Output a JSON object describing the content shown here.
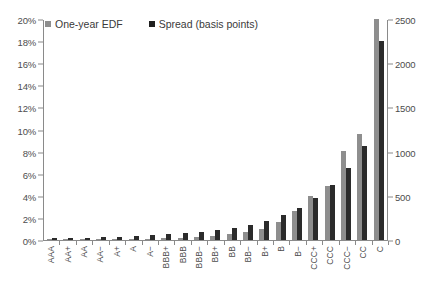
{
  "chart_data": {
    "type": "bar",
    "title": "",
    "subtitle": "",
    "xlabel": "",
    "ylabel": "",
    "y2label": "",
    "grid": false,
    "legend_position": "top-left",
    "categories": [
      "AAA",
      "AA+",
      "AA",
      "AA−",
      "A+",
      "A",
      "A−",
      "BBB+",
      "BBB",
      "BBB−",
      "BB+",
      "BB",
      "BB−",
      "B+",
      "B",
      "B−",
      "CCC+",
      "CCC",
      "CCC−",
      "CC",
      "C"
    ],
    "ylim": [
      0,
      20
    ],
    "y2lim": [
      0,
      2500
    ],
    "yticks": [
      "0%",
      "2%",
      "4%",
      "6%",
      "8%",
      "10%",
      "12%",
      "14%",
      "16%",
      "18%",
      "20%"
    ],
    "ytick_values": [
      0,
      2,
      4,
      6,
      8,
      10,
      12,
      14,
      16,
      18,
      20
    ],
    "y2ticks": [
      "0",
      "500",
      "1000",
      "1500",
      "2000",
      "2500"
    ],
    "y2tick_values": [
      0,
      500,
      1000,
      1500,
      2000,
      2500
    ],
    "series": [
      {
        "name": "One-year EDF",
        "axis": "left",
        "unit": "percent",
        "color": "#8e8e8e",
        "values": [
          0.02,
          0.03,
          0.04,
          0.05,
          0.07,
          0.09,
          0.12,
          0.16,
          0.2,
          0.26,
          0.35,
          0.5,
          0.7,
          1.0,
          1.6,
          2.6,
          4.0,
          4.9,
          8.1,
          9.6,
          20.0
        ]
      },
      {
        "name": "Spread (basis points)",
        "axis": "right",
        "unit": "basis points",
        "color": "#2b2b2b",
        "values": [
          18,
          22,
          26,
          32,
          38,
          46,
          55,
          66,
          80,
          95,
          115,
          140,
          170,
          215,
          280,
          365,
          480,
          620,
          810,
          1060,
          2250
        ]
      }
    ]
  },
  "legend": {
    "items": [
      {
        "label": "One-year EDF",
        "swatch": "gray-square-swatch"
      },
      {
        "label": "Spread (basis points)",
        "swatch": "black-square-swatch"
      }
    ]
  }
}
